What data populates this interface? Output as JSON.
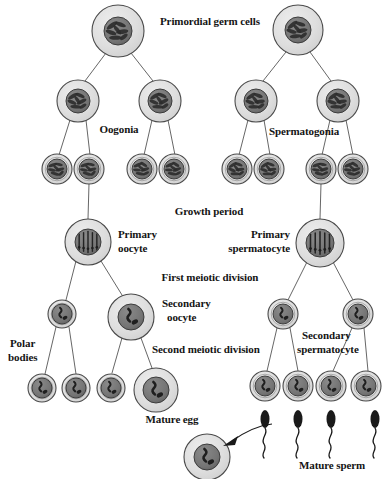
{
  "figure": {
    "background_color": "#ffffff",
    "ink_color": "#141414",
    "cytoplasm_color": "#d9d9d9",
    "nucleus_color": "#6e6e6e",
    "membrane_color": "#4a4a4a",
    "sperm_color": "#1a1a1a"
  },
  "labels": {
    "primordial_germ_cells": "Primordial germ cells",
    "oogonia": "Oogonia",
    "spermatogonia": "Spermatogonia",
    "growth_period": "Growth period",
    "primary_oocyte_line1": "Primary",
    "primary_oocyte_line2": "oocyte",
    "primary_spermatocyte_line1": "Primary",
    "primary_spermatocyte_line2": "spermatocyte",
    "first_meiotic_division": "First meiotic division",
    "secondary_oocyte_line1": "Secondary",
    "secondary_oocyte_line2": "oocyte",
    "secondary_spermatocyte_line1": "Secondary",
    "secondary_spermatocyte_line2": "spermatocyte",
    "second_meiotic_division": "Second meiotic division",
    "polar_bodies_line1": "Polar",
    "polar_bodies_line2": "bodies",
    "mature_egg": "Mature egg",
    "mature_sperm": "Mature sperm"
  },
  "label_positions": [
    {
      "name": "primordial-germ-cells-label",
      "key": "primordial_germ_cells",
      "x": 160,
      "y": 15,
      "align": "left",
      "size": 11
    },
    {
      "name": "oogonia-label",
      "key": "oogonia",
      "x": 119,
      "y": 123,
      "align": "center",
      "size": 11
    },
    {
      "name": "spermatogonia-label",
      "key": "spermatogonia",
      "x": 304,
      "y": 125,
      "align": "center",
      "size": 11
    },
    {
      "name": "growth-period-label",
      "key": "growth_period",
      "x": 209,
      "y": 205,
      "align": "center",
      "size": 11
    },
    {
      "name": "primary-oocyte-label-line1",
      "key": "primary_oocyte_line1",
      "x": 118,
      "y": 228,
      "align": "left",
      "size": 11
    },
    {
      "name": "primary-oocyte-label-line2",
      "key": "primary_oocyte_line2",
      "x": 118,
      "y": 242,
      "align": "left",
      "size": 11
    },
    {
      "name": "primary-spermatocyte-label-line1",
      "key": "primary_spermatocyte_line1",
      "x": 290,
      "y": 228,
      "align": "right",
      "size": 11
    },
    {
      "name": "primary-spermatocyte-label-line2",
      "key": "primary_spermatocyte_line2",
      "x": 290,
      "y": 242,
      "align": "right",
      "size": 11
    },
    {
      "name": "first-meiotic-division-label",
      "key": "first_meiotic_division",
      "x": 210,
      "y": 271,
      "align": "center",
      "size": 11
    },
    {
      "name": "secondary-oocyte-label-line1",
      "key": "secondary_oocyte_line1",
      "x": 162,
      "y": 297,
      "align": "left",
      "size": 11
    },
    {
      "name": "secondary-oocyte-label-line2",
      "key": "secondary_oocyte_line2",
      "x": 167,
      "y": 311,
      "align": "left",
      "size": 11
    },
    {
      "name": "secondary-spermatocyte-label-line1",
      "key": "secondary_spermatocyte_line1",
      "x": 302,
      "y": 329,
      "align": "left",
      "size": 11
    },
    {
      "name": "secondary-spermatocyte-label-line2",
      "key": "secondary_spermatocyte_line2",
      "x": 297,
      "y": 343,
      "align": "left",
      "size": 11
    },
    {
      "name": "second-meiotic-division-label",
      "key": "second_meiotic_division",
      "x": 152,
      "y": 343,
      "align": "left",
      "size": 11
    },
    {
      "name": "polar-bodies-label-line1",
      "key": "polar_bodies_line1",
      "x": 10,
      "y": 337,
      "align": "left",
      "size": 11
    },
    {
      "name": "polar-bodies-label-line2",
      "key": "polar_bodies_line2",
      "x": 8,
      "y": 351,
      "align": "left",
      "size": 11
    },
    {
      "name": "mature-egg-label",
      "key": "mature_egg",
      "x": 172,
      "y": 413,
      "align": "center",
      "size": 11
    },
    {
      "name": "mature-sperm-label",
      "key": "mature_sperm",
      "x": 332,
      "y": 459,
      "align": "center",
      "size": 11
    }
  ],
  "cells": [
    {
      "name": "primordial-germ-cell-female",
      "stage": "primordial germ cell",
      "cx": 118,
      "cy": 31,
      "r": 26,
      "nucleus_r": 14,
      "nucleus_pattern": "tangled-chromatin"
    },
    {
      "name": "primordial-germ-cell-male",
      "stage": "primordial germ cell",
      "cx": 298,
      "cy": 30,
      "r": 25,
      "nucleus_r": 13,
      "nucleus_pattern": "tangled-chromatin"
    },
    {
      "name": "oogonium-left",
      "stage": "oogonium",
      "cx": 78,
      "cy": 101,
      "r": 21,
      "nucleus_r": 12,
      "nucleus_pattern": "tangled-chromatin"
    },
    {
      "name": "oogonium-right",
      "stage": "oogonium",
      "cx": 160,
      "cy": 101,
      "r": 21,
      "nucleus_r": 12,
      "nucleus_pattern": "tangled-chromatin"
    },
    {
      "name": "spermatogonium-left",
      "stage": "spermatogonium",
      "cx": 256,
      "cy": 101,
      "r": 21,
      "nucleus_r": 12,
      "nucleus_pattern": "tangled-chromatin"
    },
    {
      "name": "spermatogonium-right",
      "stage": "spermatogonium",
      "cx": 338,
      "cy": 101,
      "r": 21,
      "nucleus_r": 12,
      "nucleus_pattern": "tangled-chromatin"
    },
    {
      "name": "oogonium-daughter-1",
      "stage": "oogonium daughter",
      "cx": 57,
      "cy": 169,
      "r": 15,
      "nucleus_r": 10,
      "nucleus_pattern": "tangled-chromatin"
    },
    {
      "name": "oogonium-daughter-2",
      "stage": "oogonium daughter",
      "cx": 89,
      "cy": 169,
      "r": 15,
      "nucleus_r": 10,
      "nucleus_pattern": "tangled-chromatin"
    },
    {
      "name": "oogonium-daughter-3",
      "stage": "oogonium daughter",
      "cx": 142,
      "cy": 169,
      "r": 15,
      "nucleus_r": 10,
      "nucleus_pattern": "tangled-chromatin"
    },
    {
      "name": "oogonium-daughter-4",
      "stage": "oogonium daughter",
      "cx": 174,
      "cy": 169,
      "r": 15,
      "nucleus_r": 10,
      "nucleus_pattern": "tangled-chromatin"
    },
    {
      "name": "spermatogonium-daughter-1",
      "stage": "spermatogonium daughter",
      "cx": 237,
      "cy": 169,
      "r": 15,
      "nucleus_r": 10,
      "nucleus_pattern": "tangled-chromatin"
    },
    {
      "name": "spermatogonium-daughter-2",
      "stage": "spermatogonium daughter",
      "cx": 269,
      "cy": 169,
      "r": 15,
      "nucleus_r": 10,
      "nucleus_pattern": "tangled-chromatin"
    },
    {
      "name": "spermatogonium-daughter-3",
      "stage": "spermatogonium daughter",
      "cx": 321,
      "cy": 169,
      "r": 15,
      "nucleus_r": 10,
      "nucleus_pattern": "tangled-chromatin"
    },
    {
      "name": "spermatogonium-daughter-4",
      "stage": "spermatogonium daughter",
      "cx": 353,
      "cy": 169,
      "r": 15,
      "nucleus_r": 10,
      "nucleus_pattern": "tangled-chromatin"
    },
    {
      "name": "primary-oocyte",
      "stage": "primary oocyte",
      "cx": 88,
      "cy": 242,
      "r": 23,
      "nucleus_r": 13,
      "nucleus_pattern": "paired-chromosomes"
    },
    {
      "name": "primary-spermatocyte",
      "stage": "primary spermatocyte",
      "cx": 320,
      "cy": 243,
      "r": 24,
      "nucleus_r": 14,
      "nucleus_pattern": "paired-chromosomes"
    },
    {
      "name": "first-polar-body",
      "stage": "first polar body",
      "cx": 62,
      "cy": 314,
      "r": 14,
      "nucleus_r": 10,
      "nucleus_pattern": "haploid-chromosomes"
    },
    {
      "name": "secondary-oocyte",
      "stage": "secondary oocyte",
      "cx": 131,
      "cy": 317,
      "r": 23,
      "nucleus_r": 13,
      "nucleus_pattern": "haploid-chromosomes"
    },
    {
      "name": "secondary-spermatocyte-left",
      "stage": "secondary spermatocyte",
      "cx": 283,
      "cy": 314,
      "r": 15,
      "nucleus_r": 10,
      "nucleus_pattern": "haploid-chromosomes"
    },
    {
      "name": "secondary-spermatocyte-right",
      "stage": "secondary spermatocyte",
      "cx": 358,
      "cy": 314,
      "r": 15,
      "nucleus_r": 10,
      "nucleus_pattern": "haploid-chromosomes"
    },
    {
      "name": "polar-body-1",
      "stage": "polar body",
      "cx": 42,
      "cy": 388,
      "r": 14,
      "nucleus_r": 10,
      "nucleus_pattern": "haploid-chromosomes"
    },
    {
      "name": "polar-body-2",
      "stage": "polar body",
      "cx": 76,
      "cy": 388,
      "r": 14,
      "nucleus_r": 10,
      "nucleus_pattern": "haploid-chromosomes"
    },
    {
      "name": "polar-body-3",
      "stage": "polar body",
      "cx": 111,
      "cy": 388,
      "r": 14,
      "nucleus_r": 10,
      "nucleus_pattern": "haploid-chromosomes"
    },
    {
      "name": "mature-egg",
      "stage": "mature egg",
      "cx": 156,
      "cy": 390,
      "r": 22,
      "nucleus_r": 13,
      "nucleus_pattern": "haploid-chromosomes"
    },
    {
      "name": "spermatid-1",
      "stage": "spermatid",
      "cx": 265,
      "cy": 386,
      "r": 15,
      "nucleus_r": 10,
      "nucleus_pattern": "haploid-chromosomes"
    },
    {
      "name": "spermatid-2",
      "stage": "spermatid",
      "cx": 298,
      "cy": 386,
      "r": 15,
      "nucleus_r": 10,
      "nucleus_pattern": "haploid-chromosomes"
    },
    {
      "name": "spermatid-3",
      "stage": "spermatid",
      "cx": 331,
      "cy": 386,
      "r": 15,
      "nucleus_r": 10,
      "nucleus_pattern": "haploid-chromosomes"
    },
    {
      "name": "spermatid-4",
      "stage": "spermatid",
      "cx": 366,
      "cy": 386,
      "r": 15,
      "nucleus_r": 10,
      "nucleus_pattern": "haploid-chromosomes"
    },
    {
      "name": "fertilized-egg",
      "stage": "mature egg (fertilization)",
      "cx": 207,
      "cy": 457,
      "r": 23,
      "nucleus_r": 13,
      "nucleus_pattern": "haploid-chromosomes"
    }
  ],
  "connectors": [
    {
      "name": "lineage-line",
      "x1": 106,
      "y1": 53,
      "x2": 85,
      "y2": 81
    },
    {
      "name": "lineage-line",
      "x1": 131,
      "y1": 53,
      "x2": 153,
      "y2": 81
    },
    {
      "name": "lineage-line",
      "x1": 286,
      "y1": 52,
      "x2": 263,
      "y2": 81
    },
    {
      "name": "lineage-line",
      "x1": 310,
      "y1": 52,
      "x2": 331,
      "y2": 81
    },
    {
      "name": "lineage-line",
      "x1": 70,
      "y1": 120,
      "x2": 59,
      "y2": 155
    },
    {
      "name": "lineage-line",
      "x1": 86,
      "y1": 120,
      "x2": 90,
      "y2": 155
    },
    {
      "name": "lineage-line",
      "x1": 152,
      "y1": 120,
      "x2": 144,
      "y2": 155
    },
    {
      "name": "lineage-line",
      "x1": 168,
      "y1": 120,
      "x2": 175,
      "y2": 155
    },
    {
      "name": "lineage-line",
      "x1": 248,
      "y1": 120,
      "x2": 239,
      "y2": 155
    },
    {
      "name": "lineage-line",
      "x1": 264,
      "y1": 120,
      "x2": 270,
      "y2": 155
    },
    {
      "name": "lineage-line",
      "x1": 330,
      "y1": 120,
      "x2": 322,
      "y2": 155
    },
    {
      "name": "lineage-line",
      "x1": 346,
      "y1": 120,
      "x2": 353,
      "y2": 155
    },
    {
      "name": "growth-line-oocyte",
      "x1": 89,
      "y1": 184,
      "x2": 88,
      "y2": 219
    },
    {
      "name": "growth-line-spermatocyte",
      "x1": 321,
      "y1": 184,
      "x2": 320,
      "y2": 219
    },
    {
      "name": "meiosis1-line",
      "x1": 76,
      "y1": 261,
      "x2": 66,
      "y2": 300
    },
    {
      "name": "meiosis1-line",
      "x1": 101,
      "y1": 261,
      "x2": 122,
      "y2": 295
    },
    {
      "name": "meiosis1-line",
      "x1": 307,
      "y1": 262,
      "x2": 288,
      "y2": 300
    },
    {
      "name": "meiosis1-line",
      "x1": 333,
      "y1": 262,
      "x2": 353,
      "y2": 300
    },
    {
      "name": "meiosis2-line",
      "x1": 56,
      "y1": 327,
      "x2": 45,
      "y2": 374
    },
    {
      "name": "meiosis2-line",
      "x1": 69,
      "y1": 327,
      "x2": 76,
      "y2": 374
    },
    {
      "name": "meiosis2-line",
      "x1": 122,
      "y1": 338,
      "x2": 112,
      "y2": 373
    },
    {
      "name": "meiosis2-line",
      "x1": 141,
      "y1": 338,
      "x2": 152,
      "y2": 368
    },
    {
      "name": "meiosis2-line",
      "x1": 277,
      "y1": 328,
      "x2": 267,
      "y2": 371
    },
    {
      "name": "meiosis2-line",
      "x1": 290,
      "y1": 328,
      "x2": 298,
      "y2": 371
    },
    {
      "name": "meiosis2-line",
      "x1": 352,
      "y1": 328,
      "x2": 333,
      "y2": 371
    },
    {
      "name": "meiosis2-line",
      "x1": 364,
      "y1": 328,
      "x2": 368,
      "y2": 371
    }
  ],
  "sperm": [
    {
      "name": "mature-sperm-1",
      "x": 265,
      "y": 419,
      "head_rx": 4.5,
      "head_ry": 9
    },
    {
      "name": "mature-sperm-2",
      "x": 298,
      "y": 419,
      "head_rx": 4.5,
      "head_ry": 9
    },
    {
      "name": "mature-sperm-3",
      "x": 331,
      "y": 419,
      "head_rx": 4.5,
      "head_ry": 9
    },
    {
      "name": "mature-sperm-4",
      "x": 375,
      "y": 419,
      "head_rx": 4.5,
      "head_ry": 9
    }
  ],
  "fertilization_arrow": {
    "name": "fertilization-arrow",
    "tail_x": 272,
    "tail_y": 424,
    "tip_x": 223,
    "tip_y": 446
  }
}
